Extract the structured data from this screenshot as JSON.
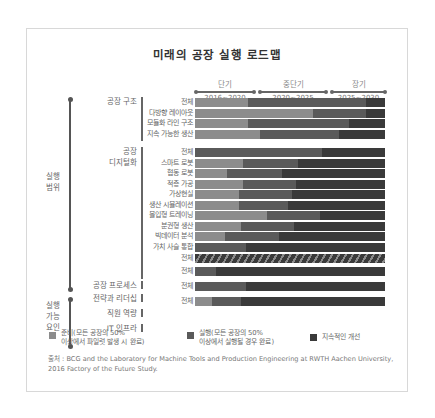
{
  "title": "미래의 공장 실행 로드맵",
  "periods": [
    {
      "label": "단기",
      "years": "2016~2020"
    },
    {
      "label": "중단기",
      "years": "2020~2025"
    },
    {
      "label": "장기",
      "years": "2025~2030"
    }
  ],
  "axis_labels": {
    "scope": "실행\n범위",
    "enablers": "실행\n가능\n요인"
  },
  "groups": [
    {
      "label": "공장 구조"
    },
    {
      "label": "공장\n디지털화"
    },
    {
      "label": "공장 프로세스"
    },
    {
      "label": "전략과 리더십"
    },
    {
      "label": "직원 역량"
    },
    {
      "label": "IT 인프라"
    }
  ],
  "legend": [
    {
      "label": "준비(모든 공장의 50%\n이상에서 파일럿 발생 시 완료)",
      "color": "#8c8c8c"
    },
    {
      "label": "실행(모든 공장의 50%\n이상에서 실행될 경우 완료)",
      "color": "#5a5a5a"
    },
    {
      "label": "지속적인 개선",
      "color": "#3a3a3a"
    }
  ],
  "source": "출처 : BCG and the Laboratory for Machine Tools and Production Engineering at RWTH Aachen University, 2016 Factory of the Future Study.",
  "colors": {
    "prep": "#8c8c8c",
    "exec": "#5a5a5a",
    "cont": "#3a3a3a"
  },
  "chart_data": {
    "type": "bar",
    "orientation": "horizontal-stacked",
    "title": "미래의 공장 실행 로드맵",
    "x_axis": {
      "range": [
        2016,
        2030
      ],
      "periods": [
        "단기 2016~2020",
        "중단기 2020~2025",
        "장기 2025~2030"
      ]
    },
    "series_names": [
      "준비(모든 공장의 50% 이상에서 파일럿 발생 시 완료)",
      "실행(모든 공장의 50% 이상에서 실행될 경우 완료)",
      "지속적인 개선"
    ],
    "unit": "percent of 2016–2030 span",
    "rows": [
      {
        "group": "공장 구조",
        "label": "전체",
        "prep": 28,
        "exec": 62,
        "cont": 10
      },
      {
        "group": "공장 구조",
        "label": "다방향 레이아웃",
        "prep": 62,
        "exec": 28,
        "cont": 10
      },
      {
        "group": "공장 구조",
        "label": "모듈화 라인 구조",
        "prep": 28,
        "exec": 53,
        "cont": 19
      },
      {
        "group": "공장 구조",
        "label": "지속 가능한 생산",
        "prep": 34,
        "exec": 42,
        "cont": 24
      },
      {
        "group": "공장 디지털화",
        "label": "전체",
        "prep": 0,
        "exec": 67,
        "cont": 33
      },
      {
        "group": "공장 디지털화",
        "label": "스마트 로봇",
        "prep": 25,
        "exec": 29,
        "cont": 46
      },
      {
        "group": "공장 디지털화",
        "label": "협동 로봇",
        "prep": 17,
        "exec": 29,
        "cont": 54
      },
      {
        "group": "공장 디지털화",
        "label": "적층 가공",
        "prep": 25,
        "exec": 28,
        "cont": 47
      },
      {
        "group": "공장 디지털화",
        "label": "가상현실",
        "prep": 23,
        "exec": 28,
        "cont": 49
      },
      {
        "group": "공장 디지털화",
        "label": "생산 시뮬레이션",
        "prep": 23,
        "exec": 26,
        "cont": 51
      },
      {
        "group": "공장 디지털화",
        "label": "몰입형 트레이닝",
        "prep": 38,
        "exec": 28,
        "cont": 34
      },
      {
        "group": "공장 디지털화",
        "label": "분권형 생산",
        "prep": 24,
        "exec": 28,
        "cont": 48
      },
      {
        "group": "공장 디지털화",
        "label": "빅데이터 분석",
        "prep": 16,
        "exec": 28,
        "cont": 56
      },
      {
        "group": "공장 디지털화",
        "label": "가치 사슬 통합",
        "prep": 0,
        "exec": 27,
        "cont": 73
      },
      {
        "group": "공장 프로세스",
        "label": "전체",
        "prep": 0,
        "exec": 0,
        "cont": 100,
        "hatched": true
      },
      {
        "group": "전략과 리더십",
        "label": "전체",
        "prep": 0,
        "exec": 11,
        "cont": 89
      },
      {
        "group": "직원 역량",
        "label": "전체",
        "prep": 0,
        "exec": 27,
        "cont": 73
      },
      {
        "group": "IT 인프라",
        "label": "전체",
        "prep": 9,
        "exec": 15,
        "cont": 76
      }
    ]
  }
}
